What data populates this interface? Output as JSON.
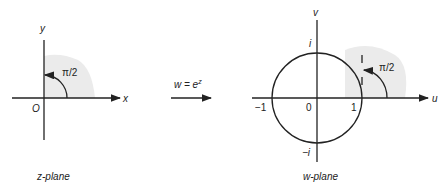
{
  "left": {
    "title": "z-plane",
    "x_axis_label": "x",
    "y_axis_label": "y",
    "origin_label": "O",
    "angle_label": "π/2"
  },
  "mapping": {
    "equation_prefix": "w = e",
    "equation_exponent": "z"
  },
  "right": {
    "title": "w-plane",
    "u_axis_label": "u",
    "v_axis_label": "v",
    "origin_label": "0",
    "tick_pos_real": "1",
    "tick_neg_real": "−1",
    "tick_pos_imag": "i",
    "tick_neg_imag": "−i",
    "angle_label": "π/2"
  },
  "colors": {
    "ink": "#222222",
    "shade": "#ebebeb"
  }
}
